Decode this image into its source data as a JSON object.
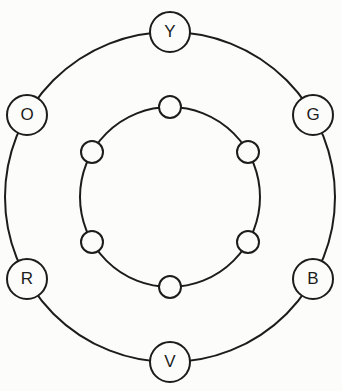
{
  "diagram": {
    "ink_color": "#1c1c1c",
    "paper_color": "#fcfcfa",
    "outer_nodes": [
      {
        "label": "Y",
        "position": "top"
      },
      {
        "label": "O",
        "position": "upper-left"
      },
      {
        "label": "G",
        "position": "upper-right"
      },
      {
        "label": "R",
        "position": "lower-left"
      },
      {
        "label": "B",
        "position": "lower-right"
      },
      {
        "label": "V",
        "position": "bottom"
      }
    ],
    "inner_nodes": [
      {
        "label": "",
        "position": "top"
      },
      {
        "label": "",
        "position": "upper-left"
      },
      {
        "label": "",
        "position": "upper-right"
      },
      {
        "label": "",
        "position": "lower-left"
      },
      {
        "label": "",
        "position": "lower-right"
      },
      {
        "label": "",
        "position": "bottom"
      }
    ]
  }
}
